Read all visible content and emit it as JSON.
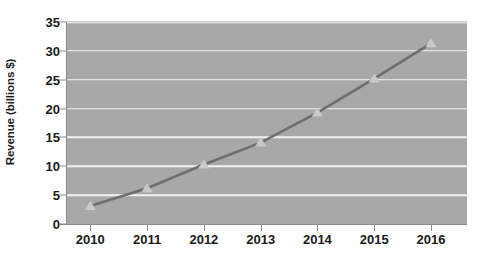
{
  "chart_data": {
    "type": "line",
    "title": "",
    "xlabel": "",
    "ylabel": "Revenue (billions $)",
    "categories": [
      "2010",
      "2011",
      "2012",
      "2013",
      "2014",
      "2015",
      "2016"
    ],
    "values": [
      3.1,
      6.2,
      10.3,
      14.1,
      19.3,
      25.2,
      31.3
    ],
    "series": [
      {
        "name": "Revenue",
        "values": [
          3.1,
          6.2,
          10.3,
          14.1,
          19.3,
          25.2,
          31.3
        ]
      }
    ],
    "ylim": [
      0,
      35
    ],
    "yticks": [
      0,
      5,
      10,
      15,
      20,
      25,
      30,
      35
    ],
    "ytick_labels": [
      "0",
      "5",
      "10",
      "15",
      "20",
      "25",
      "30",
      "35"
    ],
    "xtick_labels": [
      "2010",
      "2011",
      "2012",
      "2013",
      "2014",
      "2015",
      "2016"
    ],
    "grid": "horizontal",
    "legend": "none",
    "marker": "triangle",
    "colors": {
      "plot_background": "#a8a8a8",
      "figure_background": "#ffffff",
      "gridline": "#f2f2f2",
      "series_line": "#6e6e6e",
      "marker_fill": "#c9c9c9",
      "axis": "#8a8a8a",
      "text": "#1a1a1a"
    }
  }
}
